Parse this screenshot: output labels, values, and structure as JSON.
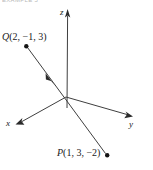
{
  "figure": {
    "caption": "EXAMPLE 5",
    "type": "3d-coordinate-axes-with-vector",
    "background_color": "#ffffff",
    "line_color": "#3a3a3a",
    "text_color": "#1a1a1a"
  },
  "axes": {
    "x": {
      "label": "x",
      "arrow": "arrowhead-left-down",
      "origin": {
        "x": 66,
        "y": 97
      },
      "tip": {
        "x": 17,
        "y": 123
      }
    },
    "y": {
      "label": "y",
      "arrow": "arrowhead-right-down",
      "origin": {
        "x": 66,
        "y": 97
      },
      "tip": {
        "x": 131,
        "y": 116
      }
    },
    "z": {
      "label": "z",
      "arrow": "arrowhead-up",
      "origin": {
        "x": 66,
        "y": 97
      },
      "tip": {
        "x": 68,
        "y": 11
      }
    }
  },
  "points": {
    "Q": {
      "name": "Q",
      "coordinates": "(2, −1, 3)",
      "label": "Q(2, −1, 3)",
      "x": 2,
      "y": -1,
      "z": 3,
      "marker": {
        "x": 26,
        "y": 46
      }
    },
    "P": {
      "name": "P",
      "coordinates": "(1, 3, −2)",
      "label": "P(1, 3, −2)",
      "x": 1,
      "y": 3,
      "z": -2,
      "marker": {
        "x": 107,
        "y": 155
      }
    }
  },
  "vector": {
    "from": "P",
    "to": "Q",
    "direction_arrow": "midpoint-arrowhead-toward-Q",
    "arrow_position": {
      "x": 50,
      "y": 80
    }
  }
}
